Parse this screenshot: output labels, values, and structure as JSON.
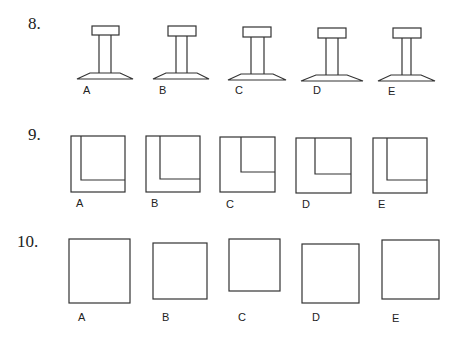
{
  "questions": [
    {
      "number": "8.",
      "type": "pedestal-figures",
      "options": [
        {
          "label": "A"
        },
        {
          "label": "B"
        },
        {
          "label": "C"
        },
        {
          "label": "D"
        },
        {
          "label": "E"
        }
      ]
    },
    {
      "number": "9.",
      "type": "nested-squares",
      "options": [
        {
          "label": "A"
        },
        {
          "label": "B"
        },
        {
          "label": "C"
        },
        {
          "label": "D"
        },
        {
          "label": "E"
        }
      ]
    },
    {
      "number": "10.",
      "type": "squares",
      "options": [
        {
          "label": "A"
        },
        {
          "label": "B"
        },
        {
          "label": "C"
        },
        {
          "label": "D"
        },
        {
          "label": "E"
        }
      ]
    }
  ]
}
